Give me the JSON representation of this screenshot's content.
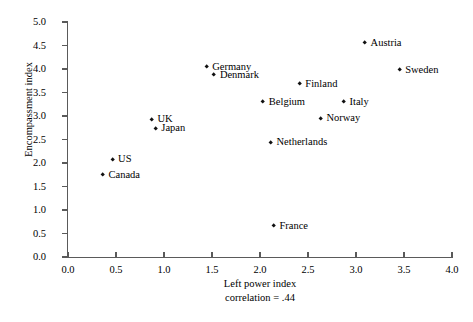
{
  "chart_data": {
    "type": "scatter",
    "title": "",
    "xlabel": "Left power index",
    "ylabel": "Encompassment index",
    "annotation": "correlation = .44",
    "xlim": [
      0.0,
      4.0
    ],
    "ylim": [
      0.0,
      5.0
    ],
    "xticks": [
      "0.0",
      "0.5",
      "1.0",
      "1.5",
      "2.0",
      "2.5",
      "3.0",
      "3.5",
      "4.0"
    ],
    "xtick_values": [
      0.0,
      0.5,
      1.0,
      1.5,
      2.0,
      2.5,
      3.0,
      3.5,
      4.0
    ],
    "yticks": [
      "0.0",
      "0.5",
      "1.0",
      "1.5",
      "2.0",
      "2.5",
      "3.0",
      "3.5",
      "4.0",
      "4.5",
      "5.0"
    ],
    "ytick_values": [
      0.0,
      0.5,
      1.0,
      1.5,
      2.0,
      2.5,
      3.0,
      3.5,
      4.0,
      4.5,
      5.0
    ],
    "grid": false,
    "legend": false,
    "marker": "diamond",
    "marker_color": "#111111",
    "points": [
      {
        "label": "Canada",
        "x": 0.37,
        "y": 1.73,
        "label_pos": "right"
      },
      {
        "label": "US",
        "x": 0.47,
        "y": 2.06,
        "label_pos": "right"
      },
      {
        "label": "UK",
        "x": 0.88,
        "y": 2.91,
        "label_pos": "right"
      },
      {
        "label": "Japan",
        "x": 0.92,
        "y": 2.72,
        "label_pos": "right"
      },
      {
        "label": "Germany",
        "x": 1.45,
        "y": 4.03,
        "label_pos": "right"
      },
      {
        "label": "Denmark",
        "x": 1.53,
        "y": 3.85,
        "label_pos": "right"
      },
      {
        "label": "Belgium",
        "x": 2.04,
        "y": 3.28,
        "label_pos": "right"
      },
      {
        "label": "France",
        "x": 2.15,
        "y": 0.64,
        "label_pos": "right"
      },
      {
        "label": "Netherlands",
        "x": 2.12,
        "y": 2.42,
        "label_pos": "right"
      },
      {
        "label": "Finland",
        "x": 2.42,
        "y": 3.66,
        "label_pos": "right"
      },
      {
        "label": "Norway",
        "x": 2.64,
        "y": 2.93,
        "label_pos": "right"
      },
      {
        "label": "Italy",
        "x": 2.88,
        "y": 3.28,
        "label_pos": "right"
      },
      {
        "label": "Austria",
        "x": 3.1,
        "y": 4.53,
        "label_pos": "right"
      },
      {
        "label": "Sweden",
        "x": 3.46,
        "y": 3.96,
        "label_pos": "right"
      }
    ]
  }
}
